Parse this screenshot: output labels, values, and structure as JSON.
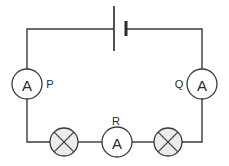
{
  "diagram": {
    "type": "circuit",
    "components": {
      "battery": {
        "label": ""
      },
      "ammeter_p": {
        "symbol": "A",
        "label": "P"
      },
      "ammeter_q": {
        "symbol": "A",
        "label": "Q"
      },
      "ammeter_r": {
        "symbol": "A",
        "label": "R"
      },
      "lamp_left": {
        "label": ""
      },
      "lamp_right": {
        "label": ""
      }
    },
    "colors": {
      "line": "#3a3a3a",
      "lamp_fill": "#ececec",
      "background": "#ffffff"
    }
  }
}
